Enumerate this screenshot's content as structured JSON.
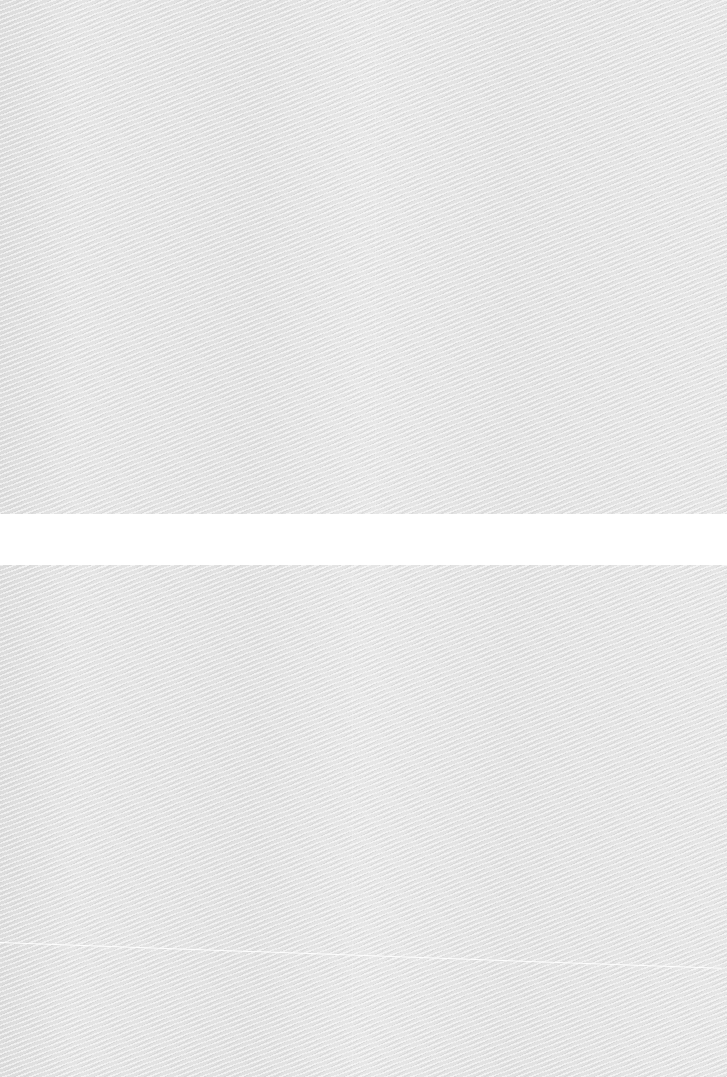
{
  "surface": {
    "description": "textured light gray surface in two panels separated by a white band",
    "texture_color": "#e2e2e2",
    "gap_color": "#ffffff",
    "panels": [
      {
        "name": "top",
        "top": 0,
        "height": 514
      },
      {
        "name": "bottom",
        "top": 565,
        "height": 512
      }
    ],
    "gap": {
      "top": 514,
      "height": 51
    },
    "crease": {
      "from": [
        0,
        942
      ],
      "to": [
        722,
        968
      ]
    }
  }
}
